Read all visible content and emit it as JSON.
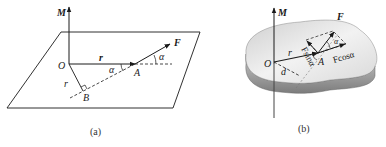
{
  "figure_a": {
    "caption": "(a)",
    "labels": {
      "moment": "M",
      "origin": "O",
      "position_vector": "r",
      "perp_r": "r",
      "force": "F",
      "point_a": "A",
      "point_b": "B",
      "angle_1": "α",
      "angle_2": "α"
    }
  },
  "figure_b": {
    "caption": "(b)",
    "labels": {
      "moment": "M",
      "origin": "O",
      "position_vector": "r",
      "force": "F",
      "point_a": "A",
      "arm": "d",
      "angle": "α",
      "sin_component": "Fsinα",
      "cos_component": "Fcosα"
    }
  },
  "colors": {
    "line": "#1a1a1a",
    "body_top": "#e8e8e8",
    "body_side": "#9a9a9a"
  }
}
